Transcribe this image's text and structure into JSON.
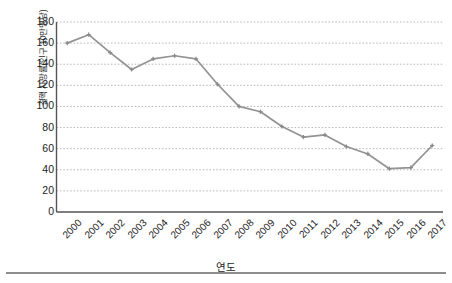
{
  "chart_data": {
    "type": "line",
    "title": "",
    "xlabel": "연도",
    "ylabel": "결핵 사망률(인구 10만명당)",
    "categories": [
      "2000",
      "2001",
      "2002",
      "2003",
      "2004",
      "2005",
      "2006",
      "2007",
      "2008",
      "2009",
      "2010",
      "2011",
      "2012",
      "2013",
      "2014",
      "2015",
      "2016",
      "2017"
    ],
    "values": [
      160,
      168,
      151,
      135,
      145,
      148,
      145,
      121,
      100,
      95,
      81,
      71,
      73,
      62,
      55,
      41,
      42,
      63
    ],
    "series": [
      {
        "name": "결핵 사망률",
        "values": [
          160,
          168,
          151,
          135,
          145,
          148,
          145,
          121,
          100,
          95,
          81,
          71,
          73,
          62,
          55,
          41,
          42,
          63
        ]
      }
    ],
    "ylim": [
      0,
      180
    ],
    "ytick_labels": [
      "180",
      "160",
      "140",
      "120",
      "100",
      "80",
      "60",
      "40",
      "20",
      "0"
    ],
    "ytick_values": [
      180,
      160,
      140,
      120,
      100,
      80,
      60,
      40,
      20,
      0
    ],
    "ytick_step": 20,
    "grid": "horizontal-dotted",
    "legend": "none",
    "line_color": "#939393",
    "marker": "cross",
    "marker_color": "#8a8a8a",
    "axis_color": "#555555",
    "grid_color": "#b9b9b9",
    "xtick_rotation": -45
  }
}
